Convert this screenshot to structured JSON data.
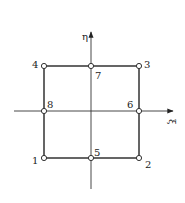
{
  "diagram": {
    "axes": {
      "horizontal": {
        "label": "ξ",
        "x1": 14,
        "x2": 173,
        "y": 111
      },
      "vertical": {
        "label": "η",
        "x": 91,
        "y1": 189,
        "y2": 32
      }
    },
    "square": {
      "left": 44,
      "top": 66,
      "right": 139,
      "bottom": 158
    },
    "nodes": [
      {
        "id": "1",
        "label": "1",
        "x": 44,
        "y": 158,
        "lx": 32,
        "ly": 164
      },
      {
        "id": "2",
        "label": "2",
        "x": 139,
        "y": 158,
        "lx": 145,
        "ly": 168
      },
      {
        "id": "3",
        "label": "3",
        "x": 139,
        "y": 66,
        "lx": 144,
        "ly": 68
      },
      {
        "id": "4",
        "label": "4",
        "x": 44,
        "y": 66,
        "lx": 32,
        "ly": 68
      },
      {
        "id": "5",
        "label": "5",
        "x": 91,
        "y": 158,
        "lx": 94,
        "ly": 156
      },
      {
        "id": "6",
        "label": "6",
        "x": 139,
        "y": 111,
        "lx": 127,
        "ly": 108
      },
      {
        "id": "7",
        "label": "7",
        "x": 91,
        "y": 66,
        "lx": 95,
        "ly": 79
      },
      {
        "id": "8",
        "label": "8",
        "x": 44,
        "y": 111,
        "lx": 47,
        "ly": 108
      }
    ],
    "colors": {
      "line": "#333333",
      "background": "#ffffff"
    }
  }
}
